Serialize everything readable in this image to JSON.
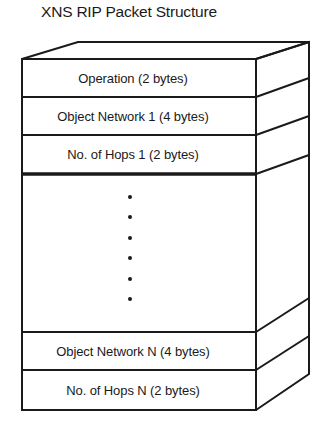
{
  "title": "XNS RIP Packet Structure",
  "fields": [
    {
      "label": "Operation (2 bytes)",
      "top": 59,
      "bottom": 97
    },
    {
      "label": "Object Network 1 (4 bytes)",
      "top": 97,
      "bottom": 135
    },
    {
      "label": "No. of Hops 1 (2 bytes)",
      "top": 135,
      "bottom": 174
    },
    {
      "label": "Object Network N (4 bytes)",
      "top": 332,
      "bottom": 370
    },
    {
      "label": "No. of Hops N (2 bytes)",
      "top": 370,
      "bottom": 410
    }
  ],
  "ellipsis": {
    "dot_count": 6,
    "note": "repeated network/hops entries"
  },
  "colors": {
    "line": "#1a1a1a",
    "background": "#ffffff"
  }
}
